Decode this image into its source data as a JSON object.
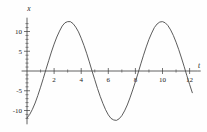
{
  "chart_data": {
    "type": "line",
    "title": "",
    "xlabel": "t",
    "ylabel": "x",
    "xlim": [
      -0.4,
      12.6
    ],
    "ylim": [
      -13.5,
      13.5
    ],
    "grid": false,
    "legend": null,
    "xticks": [
      2,
      4,
      6,
      8,
      10,
      12
    ],
    "xtick_labels": [
      "2",
      "4",
      "6",
      "8",
      "10",
      "12"
    ],
    "xticks_minor": [
      1,
      3,
      5,
      7,
      9,
      11
    ],
    "yticks": [
      -10,
      -5,
      5,
      10
    ],
    "ytick_labels": [
      "-10",
      "-5",
      "5",
      "10"
    ],
    "yticks_minor": [
      -12,
      -11,
      -9,
      -8,
      -7,
      -6,
      -4,
      -3,
      -2,
      -1,
      1,
      2,
      3,
      4,
      6,
      7,
      8,
      9,
      11,
      12
    ],
    "series": [
      {
        "name": "x(t)",
        "description": "sinusoid, amplitude 12.5, period 6.28, phase shift 1.25",
        "amplitude": 12.5,
        "period": 6.283,
        "phase": 1.25,
        "x": [
          0.0,
          0.2,
          0.4,
          0.6,
          0.8,
          1.0,
          1.2,
          1.4,
          1.6,
          1.8,
          2.0,
          2.2,
          2.4,
          2.6,
          2.8,
          3.0,
          3.2,
          3.4,
          3.6,
          3.8,
          4.0,
          4.2,
          4.4,
          4.6,
          4.8,
          5.0,
          5.2,
          5.4,
          5.6,
          5.8,
          6.0,
          6.2,
          6.4,
          6.6,
          6.8,
          7.0,
          7.2,
          7.4,
          7.6,
          7.8,
          8.0,
          8.2,
          8.4,
          8.6,
          8.8,
          9.0,
          9.2,
          9.4,
          9.6,
          9.8,
          10.0,
          10.2,
          10.4,
          10.6,
          10.8,
          11.0,
          11.2,
          11.4,
          11.6,
          11.8,
          12.0,
          12.2
        ],
        "y": [
          -11.9,
          -11.0,
          -9.7,
          -8.1,
          -6.2,
          -4.1,
          -1.9,
          0.4,
          2.6,
          4.8,
          6.8,
          8.6,
          10.1,
          11.4,
          12.2,
          12.5,
          12.5,
          12.0,
          11.1,
          9.9,
          8.3,
          6.5,
          4.5,
          2.3,
          0.0,
          -2.2,
          -4.4,
          -6.4,
          -8.2,
          -9.8,
          -11.1,
          -12.0,
          -12.4,
          -12.5,
          -12.1,
          -11.3,
          -10.1,
          -8.6,
          -6.8,
          -4.8,
          -2.7,
          -0.5,
          1.8,
          4.0,
          6.1,
          8.0,
          9.6,
          11.0,
          11.9,
          12.4,
          12.5,
          12.2,
          11.5,
          10.4,
          9.0,
          7.3,
          5.4,
          3.3,
          1.1,
          -1.2,
          -3.4,
          -5.5
        ]
      }
    ],
    "annotations": {
      "zero_crossings": [
        1.25,
        4.39,
        7.53,
        10.68
      ],
      "maxima_t": [
        2.82,
        9.11
      ],
      "minima_t": [
        5.96
      ],
      "max_value": 12.5,
      "min_value": -12.5
    }
  },
  "labels": {
    "y_axis_name": "x",
    "x_axis_name": "t"
  }
}
